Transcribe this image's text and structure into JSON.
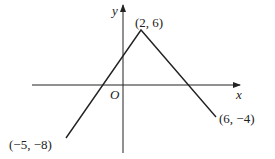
{
  "diagram": {
    "type": "piecewise-linear graph",
    "axes": {
      "x_label": "x",
      "y_label": "y",
      "origin_label": "O"
    },
    "points": [
      {
        "label": "(−5, −8)",
        "x": -5,
        "y": -8
      },
      {
        "label": "(2, 6)",
        "x": 2,
        "y": 6
      },
      {
        "label": "(6, −4)",
        "x": 6,
        "y": -4
      }
    ],
    "colors": {
      "line": "#222222",
      "background": "#ffffff"
    }
  }
}
